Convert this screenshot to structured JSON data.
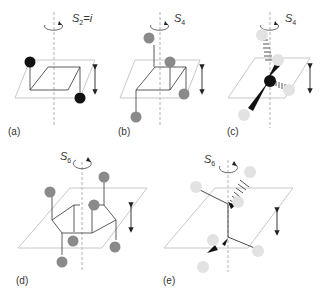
{
  "figure": {
    "panels": [
      {
        "id": "a",
        "label": "(a)",
        "operation": "S",
        "subscript": "2",
        "suffix": "=i",
        "atoms": "black",
        "description": "S2 = inversion, square plane with two black atoms"
      },
      {
        "id": "b",
        "label": "(b)",
        "operation": "S",
        "subscript": "4",
        "suffix": "",
        "atoms": "gray",
        "description": "S4 on square with four gray atoms"
      },
      {
        "id": "c",
        "label": "(c)",
        "operation": "S",
        "subscript": "4",
        "suffix": "",
        "atoms": "tetrahedral",
        "description": "S4 of tetrahedral center with wedge/hash bonds"
      },
      {
        "id": "d",
        "label": "(d)",
        "operation": "S",
        "subscript": "6",
        "suffix": "",
        "atoms": "gray",
        "description": "S6 on chair cyclohexane with six gray substituents"
      },
      {
        "id": "e",
        "label": "(e)",
        "operation": "S",
        "subscript": "6",
        "suffix": "",
        "atoms": "light",
        "description": "S6 on staggered ethane-like structure"
      }
    ]
  },
  "colors": {
    "plane": "#c8c8c8",
    "axis": "#b0b0b0",
    "bond": "#333333",
    "atom_black": "#111111",
    "atom_gray": "#8a8a8a",
    "atom_light": "#e2e2e2"
  }
}
